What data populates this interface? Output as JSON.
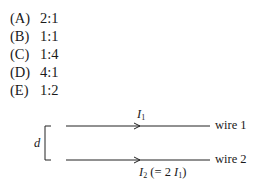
{
  "choices": [
    {
      "label": "(A)",
      "value": "2:1"
    },
    {
      "label": "(B)",
      "value": "1:1"
    },
    {
      "label": "(C)",
      "value": "1:4"
    },
    {
      "label": "(D)",
      "value": "4:1"
    },
    {
      "label": "(E)",
      "value": "1:2"
    }
  ],
  "figure": {
    "separation_label": "d",
    "wire1": {
      "name": "wire 1",
      "current": "I",
      "current_sub": "1"
    },
    "wire2": {
      "name": "wire 2",
      "current": "I",
      "current_sub": "2",
      "current_note_pre": " (= 2 ",
      "current_note_var": "I",
      "current_note_sub": "1",
      "current_note_post": ")"
    }
  }
}
